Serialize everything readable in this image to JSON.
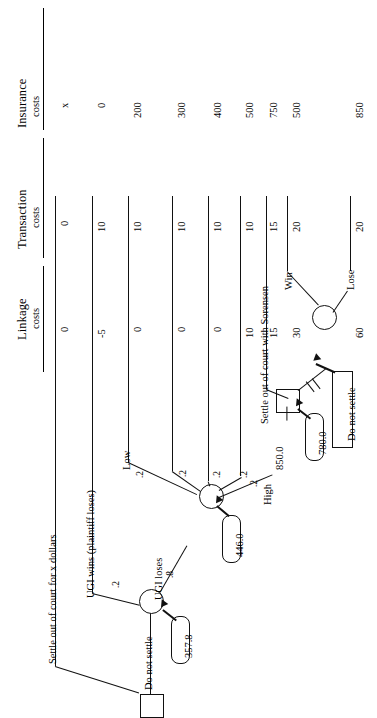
{
  "figure": {
    "orientation": "rotated-90-ccw",
    "type": "decision-tree"
  },
  "columns": [
    {
      "id": "insurance",
      "title_line1": "Insurance",
      "title_line2": "costs"
    },
    {
      "id": "transaction",
      "title_line1": "Transaction",
      "title_line2": "costs"
    },
    {
      "id": "linkage",
      "title_line1": "Linkage",
      "title_line2": "costs"
    }
  ],
  "outcomes": [
    {
      "insurance": "x",
      "transaction": "0",
      "linkage": "0"
    },
    {
      "insurance": "0",
      "transaction": "10",
      "linkage": "-5"
    },
    {
      "insurance": "200",
      "transaction": "10",
      "linkage": "0"
    },
    {
      "insurance": "300",
      "transaction": "10",
      "linkage": "0"
    },
    {
      "insurance": "400",
      "transaction": "10",
      "linkage": "0"
    },
    {
      "insurance": "500",
      "transaction": "10",
      "linkage": "10"
    },
    {
      "insurance": "750",
      "transaction": "15",
      "linkage": "15"
    },
    {
      "insurance": "500",
      "transaction": "20",
      "linkage": "30"
    },
    {
      "insurance": "850",
      "transaction": "20",
      "linkage": "60"
    }
  ],
  "tree": {
    "root_branches": {
      "settle": "Settle out of court for x dollars",
      "do_not_settle": "Do not settle"
    },
    "chance_trial": {
      "value": "357.8",
      "branch_win_label": "UGI wins (plaintiff loses)",
      "branch_win_prob": ".2",
      "branch_lose_label": "UGI loses",
      "branch_lose_prob": ".8"
    },
    "chance_award": {
      "value": "446.0",
      "branches": [
        {
          "label": "Low",
          "prob": ".2"
        },
        {
          "label": "",
          "prob": ".2"
        },
        {
          "label": "",
          "prob": ".2"
        },
        {
          "label": "",
          "prob": ".2"
        },
        {
          "label": "High",
          "prob": ".2"
        }
      ]
    },
    "decision_high": {
      "value": "780.0",
      "edge_value": "850.0",
      "branch_settle": "Settle out of court with Sorensen",
      "branch_do_not_settle": "Do not settle",
      "pruned": true
    },
    "chance_sorensen": {
      "branch_win": "Win",
      "branch_lose": "Lose"
    }
  }
}
